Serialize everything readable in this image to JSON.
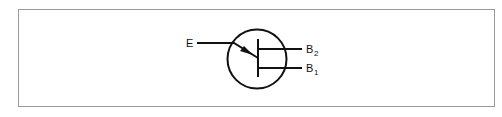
{
  "diagram": {
    "labels": {
      "emitter": "E",
      "base2_letter": "B",
      "base2_sub": "2",
      "base1_letter": "B",
      "base1_sub": "1"
    },
    "colors": {
      "stroke": "#111111",
      "frame": "#9a9a9a",
      "background": "#ffffff"
    }
  }
}
